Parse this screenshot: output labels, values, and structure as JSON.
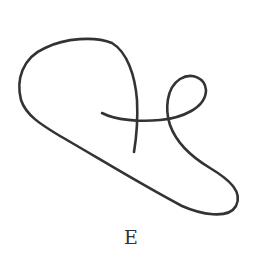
{
  "figure": {
    "type": "curve-diagram",
    "label": "E",
    "stroke_color": "#333333",
    "background": "#ffffff"
  }
}
